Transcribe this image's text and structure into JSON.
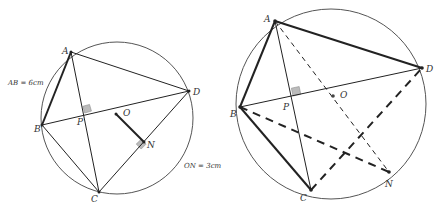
{
  "colors": {
    "stroke": "#222222",
    "circle": "#555555",
    "right_angle_fill": "#bbbbbb",
    "background": "#ffffff"
  },
  "left_figure": {
    "circle": {
      "cx": 117,
      "cy": 118,
      "r": 76
    },
    "points": {
      "A": {
        "x": 71,
        "y": 52,
        "label": "A"
      },
      "B": {
        "x": 42,
        "y": 125,
        "label": "B"
      },
      "C": {
        "x": 99,
        "y": 192,
        "label": "C"
      },
      "D": {
        "x": 189,
        "y": 91,
        "label": "D"
      },
      "P": {
        "x": 85,
        "y": 114,
        "label": "P"
      },
      "O": {
        "x": 116,
        "y": 114,
        "label": "O"
      },
      "N": {
        "x": 144,
        "y": 142,
        "label": "N"
      }
    },
    "annotations": {
      "ab_length": "AB = 6cm",
      "on_length": "ON = 3cm"
    }
  },
  "right_figure": {
    "circle": {
      "cx": 331,
      "cy": 104,
      "r": 95
    },
    "points": {
      "A": {
        "x": 275,
        "y": 21,
        "label": "A"
      },
      "B": {
        "x": 240,
        "y": 107,
        "label": "B"
      },
      "C": {
        "x": 311,
        "y": 190,
        "label": "C"
      },
      "D": {
        "x": 422,
        "y": 68,
        "label": "D"
      },
      "P": {
        "x": 293,
        "y": 96,
        "label": "P"
      },
      "O": {
        "x": 333,
        "y": 96,
        "label": "O"
      },
      "N": {
        "x": 389,
        "y": 172,
        "label": "N"
      }
    }
  }
}
